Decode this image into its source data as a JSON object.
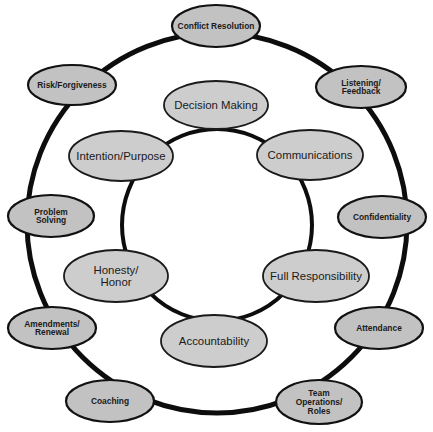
{
  "diagram": {
    "title": "",
    "colors": {
      "background": "#ffffff",
      "ring_stroke": "#0d0d0d",
      "outer_node_fill": "#c2c2c2",
      "inner_node_fill": "#cdcdcd",
      "text": "#1a1a1a"
    },
    "outer_ring": {
      "cx": 217,
      "cy": 223,
      "rx": 190,
      "ry": 190,
      "stroke_width": 5
    },
    "inner_ring": {
      "cx": 217,
      "cy": 225,
      "rx": 95,
      "ry": 96,
      "stroke_width": 4
    },
    "outer_nodes": [
      {
        "id": "conflict-resolution",
        "lines": [
          "Conflict  Resolution"
        ],
        "cx": 216,
        "cy": 26,
        "rx": 44,
        "ry": 21
      },
      {
        "id": "listening-feedback",
        "lines": [
          "Listening/",
          "Feedback"
        ],
        "cx": 361,
        "cy": 87,
        "rx": 45,
        "ry": 21
      },
      {
        "id": "confidentiality",
        "lines": [
          "Confidentiality"
        ],
        "cx": 382,
        "cy": 217,
        "rx": 44,
        "ry": 21
      },
      {
        "id": "attendance",
        "lines": [
          "Attendance"
        ],
        "cx": 379,
        "cy": 328,
        "rx": 44,
        "ry": 21
      },
      {
        "id": "team-operations-roles",
        "lines": [
          "Team",
          "Operations/",
          "Roles"
        ],
        "cx": 319,
        "cy": 402,
        "rx": 43,
        "ry": 22
      },
      {
        "id": "coaching",
        "lines": [
          "Coaching"
        ],
        "cx": 110,
        "cy": 401,
        "rx": 44,
        "ry": 21
      },
      {
        "id": "amendments-renewal",
        "lines": [
          "Amendments/",
          "Renewal"
        ],
        "cx": 52,
        "cy": 328,
        "rx": 44,
        "ry": 21
      },
      {
        "id": "problem-solving",
        "lines": [
          "Problem",
          "Solving"
        ],
        "cx": 51,
        "cy": 216,
        "rx": 43,
        "ry": 21
      },
      {
        "id": "risk-forgiveness",
        "lines": [
          "Risk/Forgiveness"
        ],
        "cx": 72,
        "cy": 85,
        "rx": 44,
        "ry": 20
      }
    ],
    "inner_nodes": [
      {
        "id": "decision-making",
        "lines": [
          "Decision  Making"
        ],
        "cx": 216,
        "cy": 105,
        "rx": 52,
        "ry": 24
      },
      {
        "id": "communications",
        "lines": [
          "Communications"
        ],
        "cx": 310,
        "cy": 155,
        "rx": 53,
        "ry": 25
      },
      {
        "id": "full-responsibility",
        "lines": [
          "Full  Responsibility"
        ],
        "cx": 316,
        "cy": 276,
        "rx": 53,
        "ry": 26
      },
      {
        "id": "accountability",
        "lines": [
          "Accountability"
        ],
        "cx": 214,
        "cy": 341,
        "rx": 53,
        "ry": 26
      },
      {
        "id": "honesty-honor",
        "lines": [
          "Honesty/",
          "Honor"
        ],
        "cx": 116,
        "cy": 276,
        "rx": 52,
        "ry": 26
      },
      {
        "id": "intention-purpose",
        "lines": [
          "Intention/Purpose"
        ],
        "cx": 121,
        "cy": 156,
        "rx": 52,
        "ry": 25
      }
    ]
  }
}
